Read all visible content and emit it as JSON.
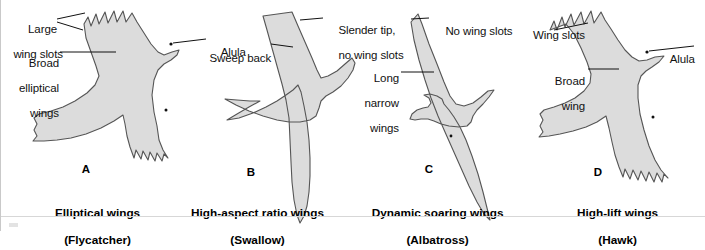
{
  "figure": {
    "background_color": "#ffffff",
    "silhouette_fill": "#dcdcdc",
    "silhouette_stroke": "#4a4a4a"
  },
  "panels": [
    {
      "letter": "A",
      "caption_line1": "Elliptical wings",
      "caption_line2": "(Flycatcher)",
      "bird": "flycatcher-silhouette",
      "annotations": [
        {
          "name": "large-wing-slots",
          "line1": "Large",
          "line2": "wing slots"
        },
        {
          "name": "broad-elliptical-wings",
          "line1": "Broad",
          "line2": "elliptical",
          "line3": "wings"
        },
        {
          "name": "alula",
          "line1": "Alula"
        }
      ]
    },
    {
      "letter": "B",
      "caption_line1": "High-aspect ratio wings",
      "caption_line2": "(Swallow)",
      "bird": "swallow-silhouette",
      "annotations": [
        {
          "name": "sweep-back",
          "line1": "Sweep back"
        },
        {
          "name": "slender-tip-no-wing-slots",
          "line1": "Slender tip,",
          "line2": "no wing slots"
        }
      ]
    },
    {
      "letter": "C",
      "caption_line1": "Dynamic soaring wings",
      "caption_line2": "(Albatross)",
      "bird": "albatross-silhouette",
      "annotations": [
        {
          "name": "no-wing-slots",
          "line1": "No wing slots"
        },
        {
          "name": "long-narrow-wings",
          "line1": "Long",
          "line2": "narrow",
          "line3": "wings"
        }
      ]
    },
    {
      "letter": "D",
      "caption_line1": "High-lift wings",
      "caption_line2": "(Hawk)",
      "bird": "hawk-silhouette",
      "annotations": [
        {
          "name": "wing-slots",
          "line1": "Wing slots"
        },
        {
          "name": "broad-wing",
          "line1": "Broad",
          "line2": "wing"
        },
        {
          "name": "alula",
          "line1": "Alula"
        }
      ]
    }
  ]
}
